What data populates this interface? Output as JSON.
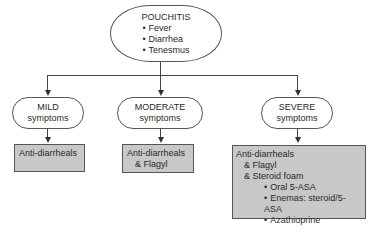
{
  "root": {
    "title": "POUCHITIS",
    "symptoms": [
      "Fever",
      "Diarrhea",
      "Tenesmus"
    ]
  },
  "severity": [
    {
      "level": "MILD",
      "sub": "symptoms",
      "treatment": {
        "lines": [
          "Anti-diarrheals"
        ],
        "bullets": []
      }
    },
    {
      "level": "MODERATE",
      "sub": "symptoms",
      "treatment": {
        "lines": [
          "Anti-diarrheals",
          "& Flagyl"
        ],
        "bullets": []
      }
    },
    {
      "level": "SEVERE",
      "sub": "symptoms",
      "treatment": {
        "lines": [
          "Anti-diarrheals",
          "& Flagyl",
          "& Steroid foam"
        ],
        "bullets": [
          "Oral 5-ASA",
          "Enemas: steroid/5-ASA",
          "Azathioprine"
        ]
      }
    }
  ],
  "colors": {
    "treatment_fill": "#c8c8c8",
    "stroke": "#555555"
  }
}
